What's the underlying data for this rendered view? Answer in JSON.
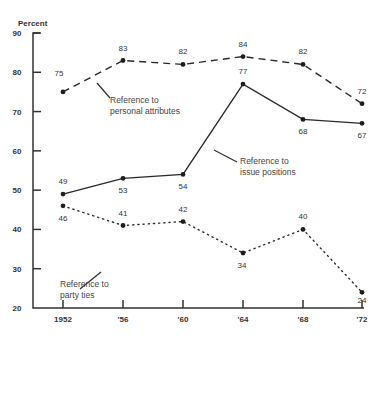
{
  "chart_data": {
    "type": "line",
    "title": "",
    "ylabel": "Percent",
    "xlabel": "",
    "ylim": [
      20,
      90
    ],
    "yticks": [
      20,
      30,
      40,
      50,
      60,
      70,
      80,
      90
    ],
    "categories": [
      "1952",
      "'56",
      "'60",
      "'64",
      "'68",
      "'72"
    ],
    "grid": false,
    "series": [
      {
        "name": "Reference to personal attributes",
        "style": "dashed",
        "values": [
          75,
          83,
          82,
          84,
          82,
          72
        ],
        "labels": [
          "75",
          "83",
          "82",
          "84",
          "82",
          "72"
        ]
      },
      {
        "name": "Reference to issue positions",
        "style": "solid",
        "values": [
          49,
          53,
          54,
          77,
          68,
          67
        ],
        "labels": [
          "49",
          "53",
          "54",
          "77",
          "68",
          "67"
        ]
      },
      {
        "name": "Reference to party ties",
        "style": "dotted",
        "values": [
          46,
          41,
          42,
          34,
          40,
          24
        ],
        "labels": [
          "46",
          "41",
          "42",
          "34",
          "40",
          "24"
        ]
      }
    ],
    "annotations": [
      {
        "series": 0,
        "lines": [
          "Reference to",
          "personal attributes"
        ]
      },
      {
        "series": 1,
        "lines": [
          "Reference to",
          "issue positions"
        ]
      },
      {
        "series": 2,
        "lines": [
          "Reference to",
          "party ties"
        ]
      }
    ]
  }
}
